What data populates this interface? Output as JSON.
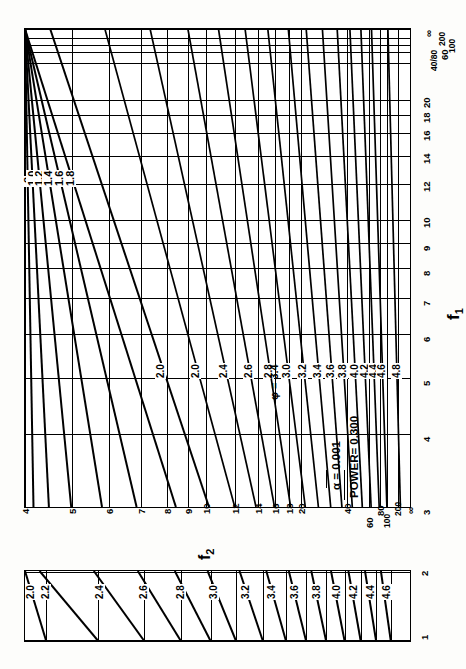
{
  "figure": {
    "kind": "pearson-hartley-power-chart",
    "orientation": "rotated-90-ccw",
    "alpha_label": "α  = 0.001",
    "power_label": "POWER= 0.300",
    "phi_marker": "φ = 3.4",
    "axis_f1": "f",
    "axis_f1_sub": "1",
    "axis_f2": "f",
    "axis_f2_sub": "2"
  },
  "chart_data": {
    "type": "line",
    "title": "",
    "subtitle": "",
    "xlabel": "f₁",
    "ylabel": "f₂",
    "grid": true,
    "legend": "none",
    "annotations": [
      "α  = 0.001",
      "POWER= 0.300",
      "φ = 3.4"
    ],
    "main_panel": {
      "x_axis": {
        "name": "f1",
        "scale": "nonlinear",
        "ticks": [
          "3",
          "4",
          "5",
          "6",
          "7",
          "8",
          "9",
          "10",
          "12",
          "14",
          "16",
          "18",
          "20",
          "40/80",
          "60",
          "100",
          "200",
          "∞"
        ],
        "range": [
          3,
          "∞"
        ]
      },
      "y_axis": {
        "name": "f2",
        "scale": "nonlinear",
        "ticks": [
          "4",
          "5",
          "6",
          "7",
          "8",
          "9",
          "10",
          "12",
          "14",
          "16",
          "18",
          "20",
          "40",
          "60",
          "80",
          "100",
          "200",
          "∞"
        ],
        "range": [
          4,
          "∞"
        ]
      },
      "curve_label_key": "φ",
      "curve_labels": [
        "∞",
        ".8",
        "1.0",
        "1.2",
        "1.4",
        "1.6",
        "1.8",
        "2.0",
        "2.0",
        "2.4",
        "2.6",
        "2.8",
        "3.0",
        "3.2",
        "3.4",
        "3.6",
        "3.8",
        "4.0",
        "4.2",
        "4.4",
        "4.6",
        "4.8"
      ],
      "curve_values": [
        0.8,
        1.0,
        1.2,
        1.4,
        1.6,
        1.8,
        2.0,
        2.2,
        2.4,
        2.6,
        2.8,
        3.0,
        3.2,
        3.4,
        3.6,
        3.8,
        4.0,
        4.2,
        4.4,
        4.6,
        4.8
      ]
    },
    "bottom_panel": {
      "x_axis": {
        "name": "f1",
        "ticks": [
          "1",
          "2"
        ],
        "range": [
          1,
          2
        ]
      },
      "curve_labels": [
        "2.0",
        "2.2",
        "2.4",
        "2.6",
        "2.8",
        "3.0",
        "3.2",
        "3.4",
        "3.6",
        "3.8",
        "4.0",
        "4.2",
        "4.4",
        "4.6"
      ],
      "curve_values": [
        2.0,
        2.2,
        2.4,
        2.6,
        2.8,
        3.0,
        3.2,
        3.4,
        3.6,
        3.8,
        4.0,
        4.2,
        4.4,
        4.6
      ]
    }
  },
  "main_x_ticks": [
    {
      "label": "3",
      "pos": 0
    },
    {
      "label": "4",
      "pos": 0.152
    },
    {
      "label": "5",
      "pos": 0.27
    },
    {
      "label": "6",
      "pos": 0.362
    },
    {
      "label": "7",
      "pos": 0.437
    },
    {
      "label": "8",
      "pos": 0.5
    },
    {
      "label": "9",
      "pos": 0.553
    },
    {
      "label": "10",
      "pos": 0.6
    },
    {
      "label": "12",
      "pos": 0.676
    },
    {
      "label": "14",
      "pos": 0.735
    },
    {
      "label": "16",
      "pos": 0.782
    },
    {
      "label": "18",
      "pos": 0.82
    },
    {
      "label": "20",
      "pos": 0.852
    },
    {
      "label": "40/80",
      "pos": 0.93
    },
    {
      "label": "60",
      "pos": 0.952
    },
    {
      "label": "100",
      "pos": 0.967
    },
    {
      "label": "200",
      "pos": 0.981
    },
    {
      "label": "∞",
      "pos": 1.0
    }
  ],
  "main_y_ticks": [
    {
      "label": "4",
      "pos": 0.0
    },
    {
      "label": "5",
      "pos": 0.122
    },
    {
      "label": "6",
      "pos": 0.218
    },
    {
      "label": "7",
      "pos": 0.3
    },
    {
      "label": "8",
      "pos": 0.368
    },
    {
      "label": "9",
      "pos": 0.424
    },
    {
      "label": "10",
      "pos": 0.47
    },
    {
      "label": "12",
      "pos": 0.546
    },
    {
      "label": "14",
      "pos": 0.604
    },
    {
      "label": "16",
      "pos": 0.65
    },
    {
      "label": "18",
      "pos": 0.686
    },
    {
      "label": "20",
      "pos": 0.718
    },
    {
      "label": "40",
      "pos": 0.836
    },
    {
      "label": "60",
      "pos": 0.893
    },
    {
      "label": "80",
      "pos": 0.922
    },
    {
      "label": "100",
      "pos": 0.94
    },
    {
      "label": "200",
      "pos": 0.97
    },
    {
      "label": "∞",
      "pos": 1.0
    }
  ],
  "bottom_x_ticks": [
    {
      "label": "1",
      "pos": 0.0
    },
    {
      "label": "2",
      "pos": 1.0
    }
  ],
  "main_curves": [
    {
      "label": ".8",
      "pos": 0.022,
      "slope": 0.88
    },
    {
      "label": "1.0",
      "pos": 0.062,
      "slope": 0.8
    },
    {
      "label": "1.2",
      "pos": 0.12,
      "slope": 0.72
    },
    {
      "label": "1.4",
      "pos": 0.2,
      "slope": 0.62
    },
    {
      "label": "1.6",
      "pos": 0.29,
      "slope": 0.52
    },
    {
      "label": "1.8",
      "pos": 0.392,
      "slope": 0.42
    },
    {
      "label": "2.0",
      "pos": 0.478,
      "slope": 0.33
    },
    {
      "label": "2.0",
      "pos": 0.545,
      "slope": 0.27
    },
    {
      "label": "2.4",
      "pos": 0.6,
      "slope": 0.22
    },
    {
      "label": "2.6",
      "pos": 0.648,
      "slope": 0.18
    },
    {
      "label": "2.8",
      "pos": 0.69,
      "slope": 0.15
    },
    {
      "label": "3.0",
      "pos": 0.728,
      "slope": 0.125
    },
    {
      "label": "3.2",
      "pos": 0.762,
      "slope": 0.105
    },
    {
      "label": "3.4",
      "pos": 0.794,
      "slope": 0.088
    },
    {
      "label": "3.6",
      "pos": 0.823,
      "slope": 0.074
    },
    {
      "label": "3.8",
      "pos": 0.85,
      "slope": 0.062
    },
    {
      "label": "4.0",
      "pos": 0.876,
      "slope": 0.052
    },
    {
      "label": "4.2",
      "pos": 0.899,
      "slope": 0.044
    },
    {
      "label": "4.4",
      "pos": 0.92,
      "slope": 0.038
    },
    {
      "label": "4.6",
      "pos": 0.94,
      "slope": 0.032
    },
    {
      "label": "4.8",
      "pos": 0.975,
      "slope": 0.026
    }
  ],
  "bottom_curves": [
    {
      "label": "2.0",
      "pos": 0.055,
      "slope": 0.105
    },
    {
      "label": "2.2",
      "pos": 0.19,
      "slope": 0.095
    },
    {
      "label": "2.4",
      "pos": 0.31,
      "slope": 0.082
    },
    {
      "label": "2.6",
      "pos": 0.405,
      "slope": 0.07
    },
    {
      "label": "2.8",
      "pos": 0.482,
      "slope": 0.058
    },
    {
      "label": "3.0",
      "pos": 0.548,
      "slope": 0.046
    },
    {
      "label": "3.2",
      "pos": 0.618,
      "slope": 0.038
    },
    {
      "label": "3.4",
      "pos": 0.678,
      "slope": 0.032
    },
    {
      "label": "3.6",
      "pos": 0.73,
      "slope": 0.028
    },
    {
      "label": "3.8",
      "pos": 0.782,
      "slope": 0.024
    },
    {
      "label": "4.0",
      "pos": 0.83,
      "slope": 0.022
    },
    {
      "label": "4.2",
      "pos": 0.872,
      "slope": 0.02
    },
    {
      "label": "4.4",
      "pos": 0.912,
      "slope": 0.018
    },
    {
      "label": "4.6",
      "pos": 0.95,
      "slope": 0.016
    }
  ],
  "colors": {
    "ink": "#000000",
    "paper": "#ffffff"
  }
}
